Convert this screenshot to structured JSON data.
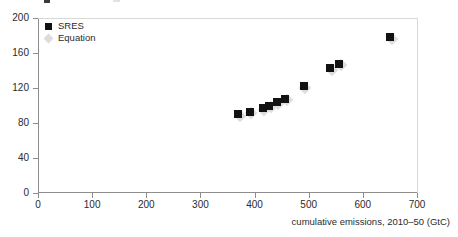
{
  "chart_data": {
    "type": "scatter",
    "title": "",
    "xlabel": "cumulative emissions, 2010–50 (GtC)",
    "ylabel": "",
    "xlim": [
      0,
      700
    ],
    "ylim": [
      0,
      200
    ],
    "xticks": [
      0,
      100,
      200,
      300,
      400,
      500,
      600,
      700
    ],
    "yticks": [
      0,
      40,
      80,
      120,
      160,
      200
    ],
    "grid": false,
    "legend_position": "top-left",
    "series": [
      {
        "name": "SRES",
        "marker": "square",
        "color": "#121212",
        "points": [
          {
            "x": 370,
            "y": 90
          },
          {
            "x": 391,
            "y": 93
          },
          {
            "x": 415,
            "y": 97
          },
          {
            "x": 427,
            "y": 100
          },
          {
            "x": 441,
            "y": 104
          },
          {
            "x": 456,
            "y": 108
          },
          {
            "x": 491,
            "y": 122
          },
          {
            "x": 540,
            "y": 143
          },
          {
            "x": 556,
            "y": 148
          },
          {
            "x": 650,
            "y": 178
          }
        ]
      },
      {
        "name": "Equation",
        "marker": "diamond",
        "color": "#dddddd",
        "points": [
          {
            "x": 373,
            "y": 88
          },
          {
            "x": 394,
            "y": 91
          },
          {
            "x": 418,
            "y": 95
          },
          {
            "x": 430,
            "y": 98
          },
          {
            "x": 444,
            "y": 102
          },
          {
            "x": 459,
            "y": 106
          },
          {
            "x": 494,
            "y": 120
          },
          {
            "x": 543,
            "y": 141
          },
          {
            "x": 559,
            "y": 146
          },
          {
            "x": 653,
            "y": 176
          }
        ]
      }
    ]
  },
  "legend": {
    "items": [
      {
        "label": "SRES",
        "marker": "square"
      },
      {
        "label": "Equation",
        "marker": "diamond"
      }
    ]
  },
  "axis": {
    "x_title": "cumulative emissions, 2010–50 (GtC)",
    "x_labels": [
      "0",
      "100",
      "200",
      "300",
      "400",
      "500",
      "600",
      "700"
    ],
    "y_labels": [
      "0",
      "40",
      "80",
      "120",
      "160",
      "200"
    ]
  },
  "colors": {
    "sres": "#121212",
    "equation": "#dddddd",
    "axis": "#8d8d8d",
    "text": "#2b2b2b",
    "background": "#ffffff"
  }
}
